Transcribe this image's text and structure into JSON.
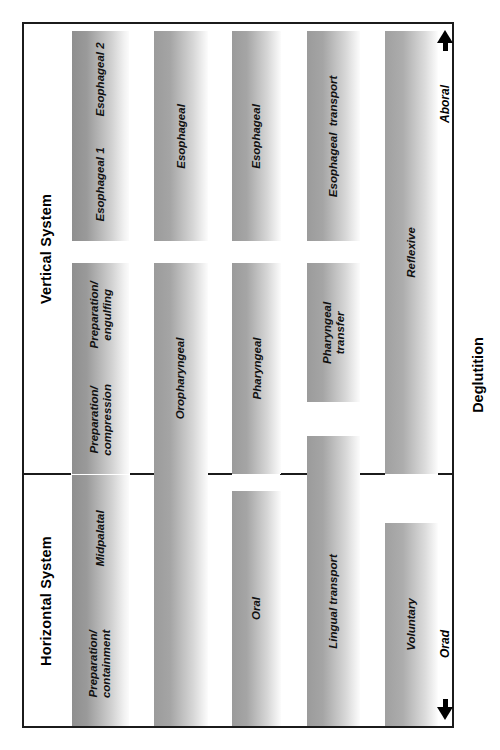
{
  "figure": {
    "caption": "Deglutition",
    "systems": [
      {
        "name": "Vertical System",
        "label": "Vertical System"
      },
      {
        "name": "Horizontal System",
        "label": "Horizontal System"
      }
    ],
    "direction_arrows": [
      {
        "label": "Aboral",
        "icon": "arrow-up-icon"
      },
      {
        "label": "Orad",
        "icon": "arrow-down-icon"
      }
    ],
    "schemes": [
      {
        "id": "scheme-1",
        "phases": [
          {
            "label": "Esophageal 2",
            "system": "Vertical System"
          },
          {
            "label": "Esophageal 1",
            "system": "Vertical System"
          },
          {
            "label": "Preparation/\nengulfing",
            "system": "Vertical System"
          },
          {
            "label": "Preparation/\ncompression",
            "system": "Vertical System"
          },
          {
            "label": "Midpalatal",
            "system": "Horizontal System"
          },
          {
            "label": "Preparation/\ncontainment",
            "system": "Horizontal System"
          }
        ]
      },
      {
        "id": "scheme-2",
        "phases": [
          {
            "label": "Esophageal",
            "system": "Vertical System"
          },
          {
            "label": "Oropharyngeal",
            "system": "Vertical System / Horizontal System"
          }
        ]
      },
      {
        "id": "scheme-3",
        "phases": [
          {
            "label": "Esophageal",
            "system": "Vertical System"
          },
          {
            "label": "Pharyngeal",
            "system": "Vertical System"
          },
          {
            "label": "Oral",
            "system": "Horizontal System"
          }
        ]
      },
      {
        "id": "scheme-4",
        "phases": [
          {
            "label": "Esophageal  transport",
            "system": "Vertical System"
          },
          {
            "label": "Pharyngeal\ntransfer",
            "system": "Vertical System"
          },
          {
            "label": "Lingual transport",
            "system": "Horizontal System"
          }
        ]
      },
      {
        "id": "scheme-5",
        "phases": [
          {
            "label": "Reflexive",
            "system": "Vertical System"
          },
          {
            "label": "Voluntary",
            "system": "Horizontal System"
          }
        ]
      }
    ],
    "colors": {
      "frame": "#1b1b1b",
      "divider": "#1b1b1b",
      "bar_dark": "#949494",
      "bar_light": "#fbfbfb",
      "text": "#111111"
    }
  }
}
